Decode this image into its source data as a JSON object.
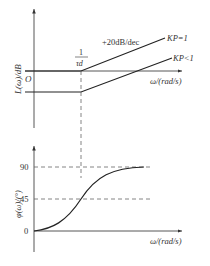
{
  "magnitude_plot": {
    "y_label": "L(ω)/dB",
    "origin_label": "O",
    "x_label": "ω/(rad/s)",
    "corner_label_numerator": "1",
    "corner_label_denominator": "τd",
    "slope_label": "+20dB/dec",
    "curves": [
      {
        "name": "Kp=1",
        "label": "KP=1"
      },
      {
        "name": "Kp<1",
        "label": "KP<1"
      }
    ]
  },
  "phase_plot": {
    "y_label": "φ(ω)/(°)",
    "x_label": "ω/(rad/s)",
    "ticks": [
      "90",
      "45",
      "0"
    ]
  },
  "colors": {
    "line": "#333333",
    "dashed": "#555555"
  }
}
